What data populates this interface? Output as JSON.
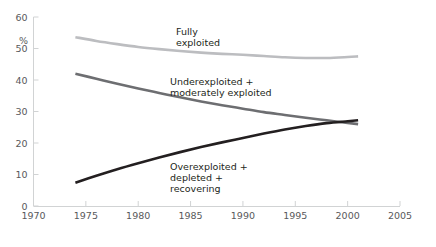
{
  "chart_data": {
    "type": "line",
    "title": "",
    "subtitle": "",
    "xlabel": "",
    "ylabel": "%",
    "xlim": [
      1970,
      2005
    ],
    "ylim": [
      0,
      60
    ],
    "xticks": [
      1970,
      1975,
      1980,
      1985,
      1990,
      1995,
      2000,
      2005
    ],
    "yticks": [
      0,
      10,
      20,
      30,
      40,
      50,
      60
    ],
    "grid": false,
    "legend_position": "inline-annotations",
    "series": [
      {
        "name": "Fully exploited",
        "label_lines": [
          "Fully",
          "exploited"
        ],
        "color": "#bcbdc0",
        "x": [
          1974,
          1976,
          1978,
          1980,
          1982,
          1984,
          1986,
          1988,
          1990,
          1992,
          1994,
          1996,
          1998,
          2000,
          2001
        ],
        "values": [
          53.6,
          52.4,
          51.4,
          50.5,
          49.8,
          49.2,
          48.7,
          48.3,
          48.0,
          47.6,
          47.2,
          47.0,
          47.0,
          47.3,
          47.5
        ]
      },
      {
        "name": "Underexploited + moderately exploited",
        "label_lines": [
          "Underexploited +",
          "moderately exploited"
        ],
        "color": "#6d6e71",
        "x": [
          1974,
          1976,
          1978,
          1980,
          1982,
          1984,
          1986,
          1988,
          1990,
          1992,
          1994,
          1996,
          1998,
          2000,
          2001
        ],
        "values": [
          42.0,
          40.4,
          38.8,
          37.3,
          35.9,
          34.5,
          33.2,
          32.0,
          30.9,
          29.8,
          28.9,
          28.0,
          27.2,
          26.4,
          26.0
        ]
      },
      {
        "name": "Overexploited + depleted + recovering",
        "label_lines": [
          "Overexploited +",
          "depleted +",
          "recovering"
        ],
        "color": "#231f20",
        "x": [
          1974,
          1976,
          1978,
          1980,
          1982,
          1984,
          1986,
          1988,
          1990,
          1992,
          1994,
          1996,
          1998,
          2000,
          2001
        ],
        "values": [
          7.4,
          9.6,
          11.7,
          13.6,
          15.4,
          17.1,
          18.7,
          20.2,
          21.6,
          23.0,
          24.3,
          25.4,
          26.3,
          26.9,
          27.2
        ]
      }
    ]
  },
  "axis": {
    "y_unit": "%",
    "y_tick_labels": [
      "0",
      "10",
      "20",
      "30",
      "40",
      "50",
      "60"
    ],
    "x_tick_labels": [
      "1970",
      "1975",
      "1980",
      "1985",
      "1990",
      "1995",
      "2000",
      "2005"
    ]
  },
  "annotations": {
    "fully_line1": "Fully",
    "fully_line2": "exploited",
    "under_line1": "Underexploited +",
    "under_line2": "moderately exploited",
    "over_line1": "Overexploited +",
    "over_line2": "depleted +",
    "over_line3": "recovering"
  },
  "colors": {
    "fully_exploited": "#bcbdc0",
    "underexploited": "#6d6e71",
    "overexploited": "#231f20",
    "axis": "#d1d3d4",
    "tick_text": "#58595b",
    "label_text": "#231f20",
    "background": "#ffffff"
  }
}
